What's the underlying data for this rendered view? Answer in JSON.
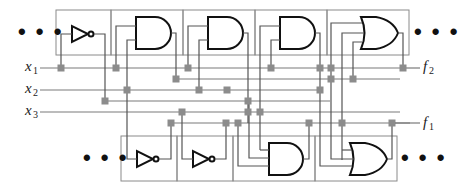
{
  "diagram": {
    "title": "",
    "type": "programmable logic block interconnect",
    "inputs": [
      {
        "name": "x",
        "sub": "1"
      },
      {
        "name": "x",
        "sub": "2"
      },
      {
        "name": "x",
        "sub": "3"
      }
    ],
    "outputs": [
      {
        "name": "f",
        "sub": "2"
      },
      {
        "name": "f",
        "sub": "1"
      }
    ],
    "ellipsis": "• • •",
    "top_row_gates": [
      "NOT",
      "AND",
      "AND",
      "AND",
      "OR"
    ],
    "bottom_row_gates": [
      "NOT",
      "NOT",
      "AND",
      "OR"
    ],
    "colors": {
      "gate_stroke": "#111111",
      "wire": "#7a7a7a",
      "switch": "#8c8c8c",
      "block_border": "#8a8a8a"
    }
  }
}
